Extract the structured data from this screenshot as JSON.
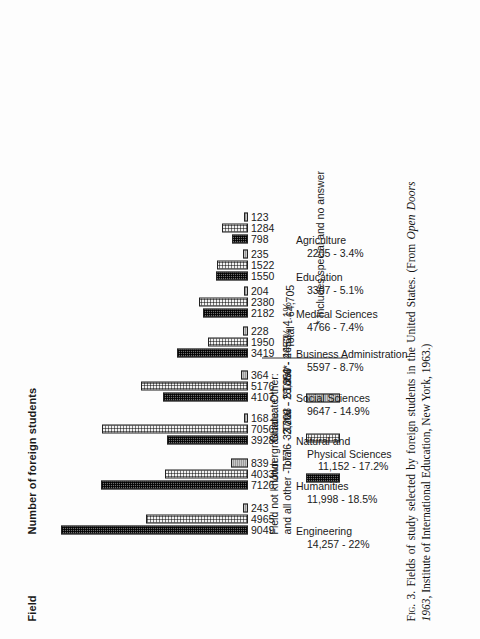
{
  "figure": {
    "column_headers": {
      "field": "Field",
      "value": "Number of foreign students"
    },
    "caption_prefix": "Fig. 3.",
    "caption": "Fields of study selected by foreign students in the United States. (From Open Doors 1963, Institute of International Education, New York, 1963.)",
    "caption_italic_part": "Open Doors 1963",
    "footnote": "* Includes special and no answer",
    "grand_total": "Total - 64,705"
  },
  "legend": {
    "unknown_note_line1": "Field not known",
    "unknown_note_line2": "and all other - 1776 - 2.7%",
    "entries": [
      {
        "name": "undergraduate",
        "label_line1": "Undergraduate:",
        "label_line2": "Total - 33,203 - 51.3%",
        "pattern": "dark-checker"
      },
      {
        "name": "graduate",
        "label_line1": "Graduate:",
        "label_line2": "Total - 28,850 - 44.6%",
        "pattern": "light-dot"
      },
      {
        "name": "other",
        "label_line1": "Other:",
        "label_line2": "Total*- 2652 - 4.1%",
        "pattern": "solid-gray"
      }
    ]
  },
  "chart_data": {
    "type": "bar",
    "title": "Fields of study selected by foreign students in the United States",
    "xlabel": "Field",
    "ylabel": "Number of foreign students",
    "ylim": [
      0,
      9500
    ],
    "grid": false,
    "legend_position": "right",
    "categories": [
      "Engineering",
      "Humanities",
      "Natural and Physical Sciences",
      "Social Sciences",
      "Business Administration",
      "Medical Sciences",
      "Education",
      "Agriculture"
    ],
    "category_labels": [
      {
        "line1": "Engineering",
        "line2": "14,257 - 22%",
        "line3": ""
      },
      {
        "line1": "Humanities",
        "line2": "11,998 - 18.5%",
        "line3": ""
      },
      {
        "line1": "Natural and",
        "line2": "Physical Sciences",
        "line3": "11,152 - 17.2%"
      },
      {
        "line1": "Social Sciences",
        "line2": "9647 - 14.9%",
        "line3": ""
      },
      {
        "line1": "Business Administration",
        "line2": "5597 - 8.7%",
        "line3": ""
      },
      {
        "line1": "Medical Sciences",
        "line2": "4766 - 7.4%",
        "line3": ""
      },
      {
        "line1": "Education",
        "line2": "3307 - 5.1%",
        "line3": ""
      },
      {
        "line1": "Agriculture",
        "line2": "2205 - 3.4%",
        "line3": ""
      }
    ],
    "category_totals": [
      "14,257",
      "11,998",
      "11,152",
      "9647",
      "5597",
      "4766",
      "3307",
      "2205"
    ],
    "category_percents": [
      "22%",
      "18.5%",
      "17.2%",
      "14.9%",
      "8.7%",
      "7.4%",
      "5.1%",
      "3.4%"
    ],
    "series": [
      {
        "name": "Undergraduate",
        "values": [
          9049,
          7126,
          3928,
          4107,
          3419,
          2182,
          1550,
          798
        ]
      },
      {
        "name": "Graduate",
        "values": [
          4965,
          4033,
          7056,
          5176,
          1950,
          2380,
          1522,
          1284
        ]
      },
      {
        "name": "Other",
        "values": [
          243,
          839,
          168,
          364,
          228,
          204,
          235,
          123
        ]
      }
    ],
    "value_labels": [
      [
        "9049",
        "4965",
        "243"
      ],
      [
        "7126",
        "4033",
        "839"
      ],
      [
        "3928",
        "7056",
        "168"
      ],
      [
        "4107",
        "5176",
        "364"
      ],
      [
        "3419",
        "1950",
        "228"
      ],
      [
        "2182",
        "2380",
        "204"
      ],
      [
        "1550",
        "1522",
        "235"
      ],
      [
        "798",
        "1284",
        "123"
      ]
    ]
  }
}
